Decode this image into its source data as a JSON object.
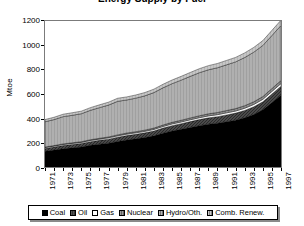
{
  "chart_data": {
    "type": "area",
    "title": "Energy Supply by Fuel",
    "xlabel": "",
    "ylabel": "Mtoe",
    "ylim": [
      0,
      1200
    ],
    "yticks": [
      0,
      200,
      400,
      600,
      800,
      1000,
      1200
    ],
    "grid": false,
    "legend_position": "bottom",
    "stacked": true,
    "x": [
      1971,
      1972,
      1973,
      1974,
      1975,
      1976,
      1977,
      1978,
      1979,
      1980,
      1981,
      1982,
      1983,
      1984,
      1985,
      1986,
      1987,
      1988,
      1989,
      1990,
      1991,
      1992,
      1993,
      1994,
      1995,
      1996,
      1997
    ],
    "xtick_labels": [
      "1971",
      "1973",
      "1975",
      "1977",
      "1979",
      "1981",
      "1983",
      "1985",
      "1987",
      "1989",
      "1991",
      "1993",
      "1995",
      "1997"
    ],
    "series": [
      {
        "name": "Coal",
        "color": "#000000",
        "pattern": "solid",
        "values": [
          130,
          140,
          150,
          158,
          165,
          178,
          188,
          196,
          210,
          222,
          232,
          243,
          256,
          278,
          296,
          310,
          325,
          340,
          352,
          360,
          372,
          385,
          405,
          432,
          470,
          530,
          590
        ]
      },
      {
        "name": "Oil",
        "color": "#555555",
        "pattern": "dense-hatch",
        "values": [
          22,
          24,
          26,
          27,
          28,
          30,
          31,
          33,
          35,
          36,
          37,
          38,
          40,
          42,
          44,
          46,
          48,
          50,
          52,
          54,
          56,
          58,
          60,
          63,
          66,
          70,
          74
        ]
      },
      {
        "name": "Gas",
        "color": "#ffffff",
        "pattern": "none",
        "values": [
          8,
          8,
          9,
          9,
          9,
          10,
          10,
          11,
          11,
          12,
          12,
          12,
          13,
          13,
          14,
          14,
          15,
          15,
          16,
          16,
          17,
          17,
          18,
          19,
          20,
          21,
          22
        ]
      },
      {
        "name": "Nuclear",
        "color": "#9a9a9a",
        "pattern": "hatch",
        "values": [
          4,
          4,
          5,
          5,
          6,
          6,
          7,
          7,
          8,
          9,
          9,
          10,
          11,
          12,
          13,
          14,
          15,
          16,
          17,
          18,
          19,
          20,
          21,
          22,
          23,
          24,
          25
        ]
      },
      {
        "name": "Hydro/Oth.",
        "color": "#b4b4b4",
        "pattern": "light-hatch",
        "values": [
          208,
          214,
          224,
          226,
          230,
          242,
          252,
          262,
          276,
          272,
          276,
          282,
          292,
          306,
          318,
          330,
          342,
          354,
          362,
          368,
          376,
          384,
          396,
          408,
          420,
          436,
          452
        ]
      },
      {
        "name": "Comb. Renew.",
        "color": "#c8c8c8",
        "pattern": "vertical-hatch",
        "values": [
          18,
          19,
          20,
          21,
          21,
          22,
          23,
          24,
          25,
          25,
          26,
          27,
          28,
          29,
          30,
          31,
          32,
          33,
          34,
          35,
          36,
          37,
          38,
          39,
          40,
          42,
          44
        ]
      }
    ],
    "totals": [
      390,
      409,
      434,
      446,
      459,
      488,
      511,
      533,
      565,
      576,
      592,
      612,
      640,
      680,
      715,
      745,
      777,
      808,
      833,
      851,
      876,
      901,
      938,
      983,
      1039,
      1123,
      1207
    ]
  },
  "axis": {
    "y_label": "Mtoe",
    "y_tick_labels": [
      "1200",
      "1000",
      "800",
      "600",
      "400",
      "200",
      "0"
    ]
  },
  "legend": {
    "items": [
      {
        "label": "Coal"
      },
      {
        "label": "Oil"
      },
      {
        "label": "Gas"
      },
      {
        "label": "Nuclear"
      },
      {
        "label": "Hydro/Oth."
      },
      {
        "label": "Comb. Renew."
      }
    ]
  }
}
